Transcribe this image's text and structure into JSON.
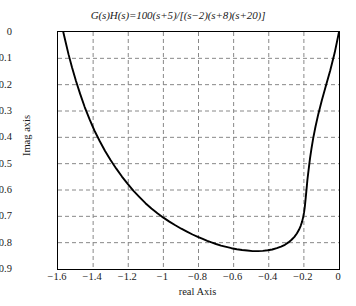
{
  "chart_data": {
    "type": "line",
    "title": "G(s)H(s)=100(s+5)/[(s−2)(s+8)(s+20)]",
    "title_parts": {
      "g": "G",
      "s1": "(s)",
      "h": "H",
      "s2": "(s)",
      "eq": "=100(s+5)/[(s−2)(s+8)(s+20)]"
    },
    "xlabel": "real Axis",
    "ylabel": "Imag axis",
    "xlim": [
      -1.6,
      0
    ],
    "ylim": [
      -0.9,
      0
    ],
    "grid": true,
    "legend": null,
    "xticks": [
      -1.6,
      -1.4,
      -1.2,
      -1,
      -0.8,
      -0.6,
      -0.4,
      -0.2,
      0
    ],
    "xtick_labels": [
      "−1.6",
      "−1.4",
      "−1.2",
      "−1",
      "−0.8",
      "−0.6",
      "−0.4",
      "−0.2",
      "0"
    ],
    "yticks": [
      0,
      -0.1,
      -0.2,
      -0.3,
      -0.4,
      -0.5,
      -0.6,
      -0.7,
      -0.8,
      -0.9
    ],
    "ytick_labels": [
      "0",
      "−0.1",
      "−0.2",
      "−0.3",
      "−0.4",
      "−0.5",
      "−0.6",
      "−0.7",
      "−0.8",
      "−0.9"
    ],
    "line_color": "#000000",
    "grid_color": "#888888",
    "series": [
      {
        "name": "Nyquist locus",
        "x": [
          -1.57,
          -1.556,
          -1.54,
          -1.52,
          -1.498,
          -1.474,
          -1.448,
          -1.42,
          -1.392,
          -1.362,
          -1.332,
          -1.3,
          -1.268,
          -1.236,
          -1.203,
          -1.17,
          -1.136,
          -1.102,
          -1.068,
          -1.034,
          -1.0,
          -0.966,
          -0.932,
          -0.898,
          -0.866,
          -0.834,
          -0.804,
          -0.776,
          -0.75,
          -0.726,
          -0.7,
          -0.672,
          -0.642,
          -0.612,
          -0.582,
          -0.552,
          -0.522,
          -0.492,
          -0.462,
          -0.434,
          -0.406,
          -0.38,
          -0.354,
          -0.33,
          -0.308,
          -0.288,
          -0.27,
          -0.254,
          -0.24,
          -0.228,
          -0.218,
          -0.21,
          -0.204,
          -0.199,
          -0.195,
          -0.192,
          -0.189,
          -0.186,
          -0.183,
          -0.18,
          -0.176,
          -0.171,
          -0.165,
          -0.157,
          -0.147,
          -0.134,
          -0.118,
          -0.098,
          -0.075,
          -0.05,
          -0.025,
          0.0
        ],
        "y": [
          0.0,
          -0.04,
          -0.085,
          -0.135,
          -0.185,
          -0.235,
          -0.285,
          -0.332,
          -0.375,
          -0.415,
          -0.452,
          -0.487,
          -0.519,
          -0.549,
          -0.577,
          -0.603,
          -0.627,
          -0.65,
          -0.67,
          -0.688,
          -0.705,
          -0.72,
          -0.734,
          -0.747,
          -0.758,
          -0.769,
          -0.778,
          -0.786,
          -0.793,
          -0.799,
          -0.805,
          -0.811,
          -0.816,
          -0.821,
          -0.825,
          -0.828,
          -0.83,
          -0.832,
          -0.832,
          -0.831,
          -0.829,
          -0.826,
          -0.821,
          -0.815,
          -0.808,
          -0.799,
          -0.789,
          -0.778,
          -0.765,
          -0.751,
          -0.736,
          -0.72,
          -0.703,
          -0.685,
          -0.666,
          -0.646,
          -0.626,
          -0.605,
          -0.584,
          -0.562,
          -0.54,
          -0.512,
          -0.48,
          -0.444,
          -0.404,
          -0.36,
          -0.312,
          -0.26,
          -0.205,
          -0.146,
          -0.08,
          0.0
        ]
      }
    ]
  }
}
